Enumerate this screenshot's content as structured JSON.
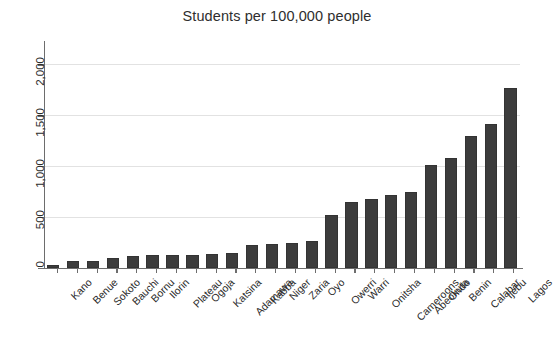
{
  "chart_data": {
    "type": "bar",
    "title": "Students per 100,000 people",
    "xlabel": "",
    "ylabel": "",
    "ylim": [
      0,
      2200
    ],
    "yticks": [
      0,
      500,
      1000,
      1500,
      2000
    ],
    "ytick_labels": [
      "0",
      "500",
      "1,000",
      "1,500",
      "2,000"
    ],
    "grid": true,
    "legend": null,
    "bar_color": "#3c3c3c",
    "background_color": "#ffffff",
    "axis_color": "#6d6d6d",
    "categories": [
      "Kano",
      "Benue",
      "Sokoto",
      "Bauchi",
      "Bornu",
      "Ilorin",
      "Plateau",
      "Ogoja",
      "Katsina",
      "Adamawa",
      "Kabba",
      "Niger",
      "Zaria",
      "Oyo",
      "Owerri",
      "Warri",
      "Onitsha",
      "Cameroons",
      "Abeokuta",
      "Ondo",
      "Benin",
      "Calabar",
      "Ijebu",
      "Lagos"
    ],
    "values": [
      30,
      72,
      72,
      98,
      118,
      126,
      128,
      130,
      142,
      146,
      228,
      232,
      248,
      268,
      525,
      650,
      680,
      715,
      742,
      1010,
      1080,
      1300,
      1415,
      1765
    ]
  },
  "figure": {
    "title": "Students per 100,000 people"
  }
}
